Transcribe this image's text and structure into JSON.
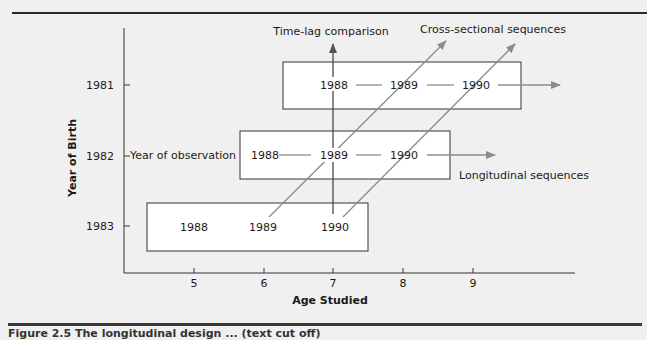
{
  "diagram": {
    "y_axis": {
      "label": "Year of Birth",
      "ticks": [
        "1981",
        "1982",
        "1983"
      ]
    },
    "x_axis": {
      "label": "Age Studied",
      "ticks": [
        "5",
        "6",
        "7",
        "8",
        "9"
      ]
    },
    "rows": [
      {
        "birth_year": "1981",
        "observations": [
          "1988",
          "1989",
          "1990"
        ]
      },
      {
        "birth_year": "1982",
        "observations": [
          "1988",
          "1989",
          "1990"
        ],
        "row_label": "Year of observation"
      },
      {
        "birth_year": "1983",
        "observations": [
          "1988",
          "1989",
          "1990"
        ]
      }
    ],
    "annotations": {
      "time_lag": "Time-lag comparison",
      "cross_sectional": "Cross-sectional sequences",
      "longitudinal": "Longitudinal sequences",
      "year_of_observation": "Year of observation"
    },
    "colors": {
      "background": "#f0f0f0",
      "box_fill": "#ffffff",
      "arrow_gray": "#8c8c8c",
      "line_dark": "#2a2a2a"
    }
  },
  "caption": "Figure 2.5  The longitudinal design ... (text cut off)"
}
